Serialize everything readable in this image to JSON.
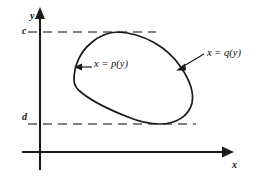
{
  "figure": {
    "background_color": "#ffffff",
    "ink_color": "#1a1a1a",
    "dash_color": "#555555"
  },
  "axes": {
    "x_axis": {
      "label": "x",
      "icon": "axis-arrow-right-icon",
      "start_px": [
        22,
        152
      ],
      "end_px": [
        228,
        152
      ]
    },
    "y_axis": {
      "label": "y",
      "icon": "axis-arrow-up-icon",
      "start_px": [
        40,
        170
      ],
      "end_px": [
        40,
        10
      ]
    },
    "origin_px": [
      40,
      152
    ]
  },
  "bounds": {
    "upper": {
      "label": "c",
      "y_px": 32,
      "dash_start_px": 28,
      "dash_end_px": 156,
      "description": "horizontal dashed line y = c tangent to top of region"
    },
    "lower": {
      "label": "d",
      "y_px": 124,
      "dash_start_px": 28,
      "dash_end_px": 196,
      "description": "horizontal dashed line y = d tangent to bottom of region"
    }
  },
  "region": {
    "name": "closed-region",
    "left_boundary": {
      "label": "x = p(y)",
      "arrow": "arrow-left-icon",
      "arrow_tip_px": [
        76,
        67
      ],
      "arrow_tail_px": [
        92,
        67
      ]
    },
    "right_boundary": {
      "label": "x = q(y)",
      "arrow": "arrow-down-left-icon",
      "arrow_tip_px": [
        176,
        70
      ],
      "arrow_tail_px": [
        204,
        54
      ]
    },
    "top_tangent_px": [
      118,
      32
    ],
    "bottom_tangent_px": [
      155,
      124
    ],
    "leftmost_px": [
      74,
      80
    ],
    "rightmost_px": [
      192,
      103
    ]
  }
}
